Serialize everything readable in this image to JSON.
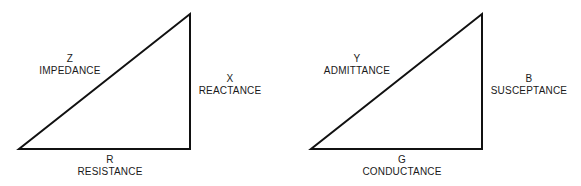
{
  "diagrams": [
    {
      "name": "impedance-triangle",
      "hypotenuse": {
        "symbol": "Z",
        "label": "IMPEDANCE"
      },
      "vertical": {
        "symbol": "X",
        "label": "REACTANCE"
      },
      "base": {
        "symbol": "R",
        "label": "RESISTANCE"
      }
    },
    {
      "name": "admittance-triangle",
      "hypotenuse": {
        "symbol": "Y",
        "label": "ADMITTANCE"
      },
      "vertical": {
        "symbol": "B",
        "label": "SUSCEPTANCE"
      },
      "base": {
        "symbol": "G",
        "label": "CONDUCTANCE"
      }
    }
  ],
  "colors": {
    "line": "#111111",
    "background": "#ffffff"
  }
}
